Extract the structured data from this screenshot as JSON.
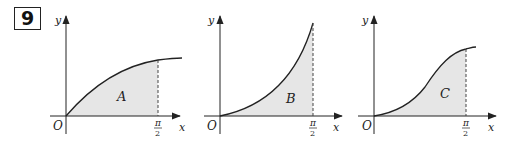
{
  "question_number": "9",
  "graphs": [
    {
      "id": "A",
      "region_label": "A",
      "curve_shape": "concave-down increasing from origin (like sin x)",
      "x_axis_label": "x",
      "y_axis_label": "y",
      "origin_label": "O",
      "x_mark": {
        "numerator": "π",
        "denominator": "2"
      }
    },
    {
      "id": "B",
      "region_label": "B",
      "curve_shape": "concave-up increasing from origin (like tan x)",
      "x_axis_label": "x",
      "y_axis_label": "y",
      "origin_label": "O",
      "x_mark": {
        "numerator": "π",
        "denominator": "2"
      }
    },
    {
      "id": "C",
      "region_label": "C",
      "curve_shape": "S-shaped increasing from origin (like sin² x)",
      "x_axis_label": "x",
      "y_axis_label": "y",
      "origin_label": "O",
      "x_mark": {
        "numerator": "π",
        "denominator": "2"
      }
    }
  ],
  "colors": {
    "shade": "#e6e6e6",
    "ink": "#222222"
  }
}
